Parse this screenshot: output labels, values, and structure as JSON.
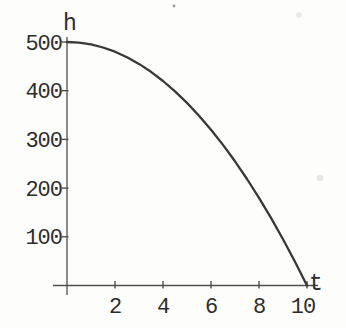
{
  "figure": {
    "background": "#fbfbf7",
    "curve_color": "#383838",
    "axis_color": "#4f4f4f",
    "text_color": "#2d2d2d",
    "artifacts": [
      {
        "x": 174,
        "y": 6,
        "r": 1.4,
        "color": "#9a9a96"
      },
      {
        "x": 299,
        "y": 15,
        "r": 3.0,
        "color": "#ebebe5"
      },
      {
        "x": 320,
        "y": 178,
        "r": 3.2,
        "color": "#e7e7e1"
      }
    ]
  },
  "chart_data": {
    "type": "line",
    "title": "",
    "xlabel": "t",
    "ylabel": "h",
    "x": [
      0,
      0.5,
      1,
      1.5,
      2,
      2.5,
      3,
      3.5,
      4,
      4.5,
      5,
      5.5,
      6,
      6.5,
      7,
      7.5,
      8,
      8.5,
      9,
      9.5,
      10
    ],
    "values": [
      500,
      498.75,
      495,
      488.75,
      480,
      468.75,
      455,
      438.75,
      420,
      398.75,
      375,
      348.75,
      320,
      288.75,
      255,
      218.75,
      180,
      138.75,
      95,
      48.75,
      0
    ],
    "x_ticks": [
      2,
      4,
      6,
      8,
      10
    ],
    "y_ticks": [
      100,
      200,
      300,
      400,
      500
    ],
    "x_tick_labels": [
      "2",
      "4",
      "6",
      "8",
      "10"
    ],
    "y_tick_labels": [
      "100",
      "200",
      "300",
      "400",
      "500"
    ],
    "xlim": [
      0,
      10.5
    ],
    "ylim": [
      0,
      515
    ],
    "grid": false,
    "legend": null
  }
}
